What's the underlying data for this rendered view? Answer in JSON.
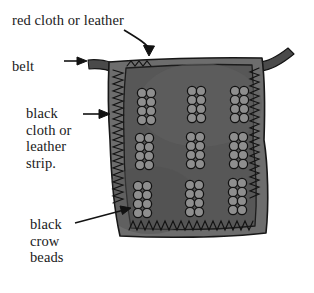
{
  "labels": {
    "red_cloth": "red cloth or leather",
    "belt": "belt",
    "black_strip_lines": [
      "black",
      "cloth or",
      "leather",
      "strip."
    ],
    "black_strip": "black cloth or leather strip.",
    "crow_beads_lines": [
      "black",
      "crow",
      "beads"
    ],
    "crow_beads": "black crow beads"
  },
  "colors": {
    "panel_fill": "#575757",
    "panel_fill_light": "#616161",
    "border_strip": "#6d6d6d",
    "belt_strap": "#4a4a4a",
    "stitching": "#131313",
    "bead_outline": "#121212",
    "bead_fill": "#8e8e8e",
    "text": "#1a1a1a",
    "arrow": "#121212",
    "background": "#ffffff"
  },
  "panel": {
    "bead_clusters": {
      "rows": 3,
      "columns": 3,
      "beads_per_cluster_rows": 4,
      "beads_per_cluster_cols": 2,
      "total_clusters": 9,
      "total_beads": 72
    }
  },
  "arrows": [
    {
      "name": "red-cloth-arrow",
      "from": "red cloth or leather",
      "to": "panel top edge"
    },
    {
      "name": "belt-arrow",
      "from": "belt",
      "to": "left belt strap"
    },
    {
      "name": "black-strip-arrow",
      "from": "black cloth or leather strip.",
      "to": "left border strip"
    },
    {
      "name": "crow-beads-arrow",
      "from": "black crow beads",
      "to": "lower left bead cluster"
    }
  ]
}
